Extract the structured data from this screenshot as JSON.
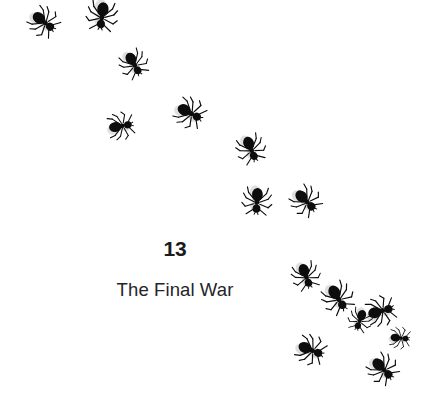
{
  "page": {
    "background_color": "#ffffff",
    "width": 422,
    "height": 405,
    "kind": "book-chapter-opening-page"
  },
  "heading": {
    "chapter_number": "13",
    "chapter_title": "The Final War",
    "number_color": "#1b1b1b",
    "title_color": "#24242a"
  },
  "illustration": {
    "subject_icon": "ant-icon",
    "description": "Trail of black ants moving diagonally from upper-left to lower-right",
    "ant_color": "#0d0d0d",
    "ant_count": 15,
    "ants": [
      {
        "name": "ant-1",
        "x": 24,
        "y": 2,
        "scale": 1.0,
        "rotate": 128
      },
      {
        "name": "ant-2",
        "x": 82,
        "y": -4,
        "scale": 1.05,
        "rotate": 188
      },
      {
        "name": "ant-3",
        "x": 114,
        "y": 44,
        "scale": 0.95,
        "rotate": 150
      },
      {
        "name": "ant-4",
        "x": 101,
        "y": 106,
        "scale": 0.92,
        "rotate": 80
      },
      {
        "name": "ant-5",
        "x": 170,
        "y": 93,
        "scale": 1.02,
        "rotate": 118
      },
      {
        "name": "ant-6",
        "x": 231,
        "y": 129,
        "scale": 0.98,
        "rotate": 158
      },
      {
        "name": "ant-7",
        "x": 237,
        "y": 181,
        "scale": 1.0,
        "rotate": 184
      },
      {
        "name": "ant-8",
        "x": 286,
        "y": 181,
        "scale": 1.0,
        "rotate": 135
      },
      {
        "name": "ant-9",
        "x": 286,
        "y": 256,
        "scale": 0.95,
        "rotate": 160
      },
      {
        "name": "ant-10",
        "x": 318,
        "y": 278,
        "scale": 1.05,
        "rotate": 148
      },
      {
        "name": "ant-11",
        "x": 361,
        "y": 291,
        "scale": 1.0,
        "rotate": 75
      },
      {
        "name": "ant-12",
        "x": 291,
        "y": 330,
        "scale": 1.0,
        "rotate": 112
      },
      {
        "name": "ant-13",
        "x": 363,
        "y": 349,
        "scale": 1.0,
        "rotate": 135
      },
      {
        "name": "ant-14",
        "x": 340,
        "y": 300,
        "scale": 0.8,
        "rotate": 200
      },
      {
        "name": "ant-15",
        "x": 380,
        "y": 318,
        "scale": 0.72,
        "rotate": 95
      }
    ]
  }
}
